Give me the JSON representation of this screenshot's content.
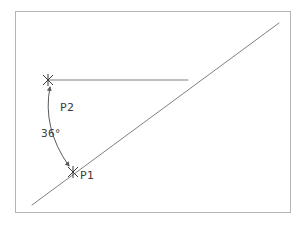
{
  "figure": {
    "type": "geometry-diagram",
    "background_color": "#ffffff",
    "frame": {
      "name": "diagram-border",
      "x": 15,
      "y": 11,
      "width": 276,
      "height": 202,
      "stroke_color": "#b4b4b4",
      "stroke_width": 1
    },
    "labels": {
      "p1": "P1",
      "p2": "P2",
      "angle": "36°"
    },
    "label_positions": {
      "p1": {
        "x": 80,
        "y": 179
      },
      "p2": {
        "x": 60,
        "y": 111
      },
      "angle": {
        "x": 41,
        "y": 137
      }
    },
    "points": [
      {
        "id": "P2",
        "label": "P2",
        "marker": "x-cross-marker",
        "x": 48,
        "y": 80,
        "color": "#3b3b3b"
      },
      {
        "id": "P1",
        "label": "P1",
        "marker": "x-cross-marker",
        "x": 73,
        "y": 172,
        "color": "#3b3b3b"
      }
    ],
    "lines": [
      {
        "id": "diagonal-line",
        "name": "diagonal-ray",
        "x1": 32,
        "y1": 205,
        "x2": 279,
        "y2": 23,
        "stroke_color": "#808080",
        "stroke_width": 1
      },
      {
        "id": "horizontal-line",
        "name": "horizontal-ray",
        "x1": 48,
        "y1": 80,
        "x2": 188,
        "y2": 80,
        "stroke_color": "#808080",
        "stroke_width": 1
      }
    ],
    "angle_arc": {
      "name": "angle-arc",
      "value": 36,
      "unit": "degrees",
      "display": "36°",
      "start": {
        "x": 50,
        "y": 86
      },
      "end": {
        "x": 70,
        "y": 167
      },
      "control": {
        "x": 44,
        "y": 128
      },
      "stroke_color": "#5a5a5a",
      "stroke_width": 1,
      "arrowheads": "both"
    },
    "colors": {
      "line": "#808080",
      "arc": "#5a5a5a",
      "text": "#3b3b3b",
      "frame": "#b4b4b4",
      "marker": "#3b3b3b",
      "background": "#ffffff"
    }
  }
}
